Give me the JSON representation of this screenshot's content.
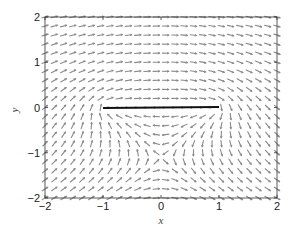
{
  "chart_data": {
    "type": "quiver",
    "title": "",
    "xlabel": "x",
    "ylabel": "y",
    "xlim": [
      -2,
      2
    ],
    "ylim": [
      -2,
      2
    ],
    "grid": false,
    "x_ticks": [
      -2,
      -1,
      0,
      1,
      2
    ],
    "y_ticks": [
      -2,
      -1,
      0,
      1,
      2
    ],
    "x_tick_labels": [
      "−2",
      "−1",
      "0",
      "1",
      "2"
    ],
    "y_tick_labels": [
      "−2",
      "−1",
      "0",
      "1",
      "2"
    ],
    "vector_field": {
      "description": "Direction field of flow around a flat plate with circulation: velocity = conj(1 + i*k/sqrt(z^2-1))",
      "k": 1.5,
      "nx": 26,
      "ny": 21,
      "arrow_color": "#8a8a8a",
      "arrow_length_px": 6.5
    },
    "segments": [
      {
        "name": "plate",
        "x": [
          -1,
          1
        ],
        "y": [
          0,
          0
        ],
        "color": "#111111",
        "linewidth": 2
      }
    ]
  }
}
